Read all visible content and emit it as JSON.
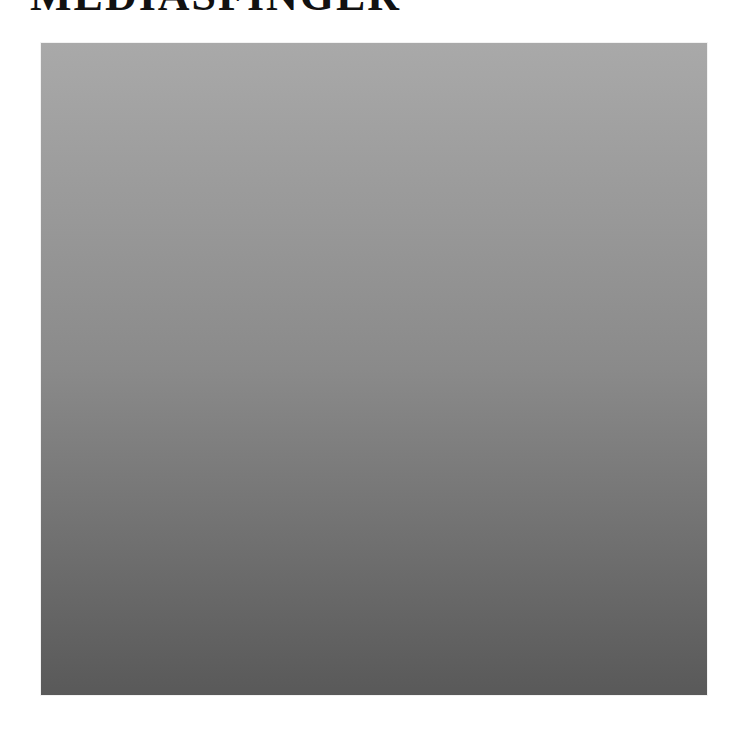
{
  "header": {
    "title": "MEDIASFINGER"
  },
  "panel": {
    "top_color": "#a9a9a9",
    "bottom_color": "#595959"
  }
}
